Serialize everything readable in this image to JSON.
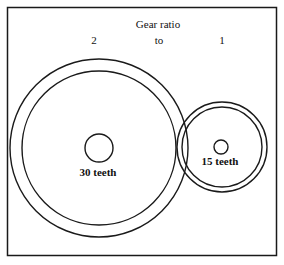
{
  "title": "Gear ratio",
  "ratio": {
    "left": "2",
    "middle": "to",
    "right": "1"
  },
  "gears": [
    {
      "name": "large-gear",
      "label": "30 teeth"
    },
    {
      "name": "small-gear",
      "label": "15 teeth"
    }
  ],
  "colors": {
    "stroke": "#1a1a1a",
    "background": "#ffffff"
  }
}
